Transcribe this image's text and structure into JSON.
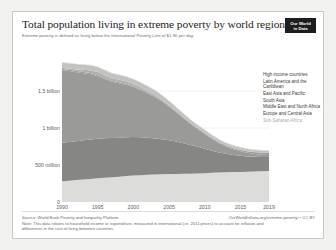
{
  "header": {
    "title": "Total population living in extreme poverty by world region",
    "subtitle": "Extreme poverty is defined as living below the International Poverty Line of $1.90 per day.",
    "logo_line1": "Our World",
    "logo_line2": "in Data"
  },
  "footer": {
    "source": "Source: World Bank Poverty and Inequality Platform",
    "note": "Note: This data relates to household income or expenditure, measured in international (i.e. 2011 prices) to account for inflation and differences in the cost of living between countries.",
    "link": "OurWorldInData.org/extreme-poverty/ • CC BY"
  },
  "legend": {
    "items": [
      {
        "label": "High income countries",
        "color": "#d8d8d6",
        "faint": false
      },
      {
        "label": "Latin America and the Caribbean",
        "color": "#c2c2c0",
        "faint": false
      },
      {
        "label": "East Asia and Pacific",
        "color": "#9a9a98",
        "faint": false
      },
      {
        "label": "South Asia",
        "color": "#868684",
        "faint": false
      },
      {
        "label": "Middle East and North Africa",
        "color": "#9d9d9b",
        "faint": false
      },
      {
        "label": "Europe and Central Asia",
        "color": "#b0b0ae",
        "faint": false
      },
      {
        "label": "Sub-Saharan Africa",
        "color": "#dcdcda",
        "faint": true
      }
    ]
  },
  "chart_data": {
    "type": "area",
    "title": "Total population living in extreme poverty by world region",
    "subtitle": "Extreme poverty is defined as living below the International Poverty Line of $1.90 per day.",
    "xlabel": "",
    "ylabel": "",
    "stacked": true,
    "grid": true,
    "legend_position": "right",
    "xlim": [
      1990,
      2019
    ],
    "ylim": [
      0,
      2000000000
    ],
    "x_ticks": [
      1990,
      1995,
      2000,
      2005,
      2010,
      2015,
      2019
    ],
    "x_tick_labels": [
      "1990",
      "1995",
      "2000",
      "2005",
      "2010",
      "2015",
      "2019"
    ],
    "y_ticks": [
      0,
      500000000,
      1000000000,
      1500000000
    ],
    "y_tick_labels": [
      "0",
      "500 million",
      "1 billion",
      "1.5 billion"
    ],
    "x": [
      1990,
      1991,
      1992,
      1993,
      1994,
      1995,
      1996,
      1997,
      1998,
      1999,
      2000,
      2001,
      2002,
      2003,
      2004,
      2005,
      2006,
      2007,
      2008,
      2009,
      2010,
      2011,
      2012,
      2013,
      2014,
      2015,
      2016,
      2017,
      2018,
      2019
    ],
    "series": [
      {
        "name": "Sub-Saharan Africa",
        "color": "#dcdcda",
        "values": [
          280000000,
          288000000,
          296000000,
          304000000,
          312000000,
          320000000,
          327000000,
          334000000,
          342000000,
          350000000,
          357000000,
          362000000,
          368000000,
          372000000,
          376000000,
          378000000,
          380000000,
          381000000,
          382000000,
          386000000,
          390000000,
          394000000,
          398000000,
          401000000,
          404000000,
          407000000,
          410000000,
          413000000,
          416000000,
          420000000
        ]
      },
      {
        "name": "South Asia",
        "color": "#868684",
        "values": [
          520000000,
          522000000,
          526000000,
          530000000,
          534000000,
          536000000,
          534000000,
          530000000,
          527000000,
          524000000,
          520000000,
          512000000,
          500000000,
          487000000,
          473000000,
          458000000,
          436000000,
          412000000,
          388000000,
          360000000,
          330000000,
          300000000,
          272000000,
          250000000,
          232000000,
          218000000,
          206000000,
          198000000,
          192000000,
          188000000
        ]
      },
      {
        "name": "East Asia and Pacific",
        "color": "#9a9a98",
        "values": [
          980000000,
          960000000,
          930000000,
          905000000,
          880000000,
          845000000,
          800000000,
          760000000,
          735000000,
          710000000,
          676000000,
          640000000,
          600000000,
          560000000,
          510000000,
          452000000,
          396000000,
          340000000,
          286000000,
          240000000,
          200000000,
          160000000,
          124000000,
          96000000,
          76000000,
          60000000,
          48000000,
          38000000,
          32000000,
          28000000
        ]
      },
      {
        "name": "Middle East and North Africa",
        "color": "#9d9d9b",
        "values": [
          18000000,
          17500000,
          17000000,
          16500000,
          16000000,
          15500000,
          15000000,
          14500000,
          14000000,
          13500000,
          13000000,
          12500000,
          12000000,
          11500000,
          11000000,
          10500000,
          10000000,
          9500000,
          9000000,
          9500000,
          10000000,
          11000000,
          12000000,
          14000000,
          16000000,
          18000000,
          20000000,
          22000000,
          24000000,
          26000000
        ]
      },
      {
        "name": "Europe and Central Asia",
        "color": "#b0b0ae",
        "values": [
          12000000,
          16000000,
          22000000,
          30000000,
          36000000,
          40000000,
          38000000,
          35000000,
          34000000,
          33000000,
          30000000,
          26000000,
          22000000,
          18000000,
          15000000,
          12000000,
          10000000,
          8000000,
          7000000,
          7000000,
          6500000,
          6000000,
          5500000,
          5000000,
          4800000,
          4600000,
          4400000,
          4200000,
          4000000,
          4000000
        ]
      },
      {
        "name": "Latin America and the Caribbean",
        "color": "#c2c2c0",
        "values": [
          70000000,
          70000000,
          69000000,
          68000000,
          68000000,
          67000000,
          66000000,
          64000000,
          63000000,
          63000000,
          62000000,
          61000000,
          62000000,
          61000000,
          57000000,
          53000000,
          48000000,
          44000000,
          40000000,
          38000000,
          36000000,
          34000000,
          32000000,
          30000000,
          29000000,
          28000000,
          28000000,
          28000000,
          27000000,
          26000000
        ]
      },
      {
        "name": "High income countries",
        "color": "#d8d8d6",
        "values": [
          8000000,
          8000000,
          8000000,
          8000000,
          8000000,
          8000000,
          8000000,
          8000000,
          8000000,
          8000000,
          8000000,
          8000000,
          8000000,
          8000000,
          8000000,
          8000000,
          7500000,
          7000000,
          7000000,
          7000000,
          7000000,
          7000000,
          7000000,
          7000000,
          7000000,
          7000000,
          7000000,
          7000000,
          7000000,
          7000000
        ]
      }
    ]
  }
}
